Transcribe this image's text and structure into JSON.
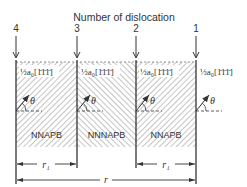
{
  "title": "Number of dislocation",
  "dislocations": [
    {
      "number": "4",
      "x": 16
    },
    {
      "number": "3",
      "x": 77
    },
    {
      "number": "2",
      "x": 136
    },
    {
      "number": "1",
      "x": 196
    }
  ],
  "burgers_label": "½a₀[1̄1̄1̄]",
  "burgers_labels": [
    "½a₀[1̄1̄1̄]",
    "½a₀[1̄1̄1̄]",
    "½a₀[1̄1̄1̄]",
    "½a₀[1̄1̄1̄]"
  ],
  "angle_symbol": "θ",
  "regions": [
    {
      "label": "NNAPB",
      "hatch": "forward"
    },
    {
      "label": "NNNAPB",
      "hatch": "backward"
    },
    {
      "label": "NNAPB",
      "hatch": "forward"
    }
  ],
  "dimensions": {
    "r1_left": "r₁",
    "r1_right": "r₁",
    "r": "r"
  },
  "colors": {
    "line": "#333333",
    "hatch": "#8a8a8a",
    "background": "#ffffff"
  }
}
